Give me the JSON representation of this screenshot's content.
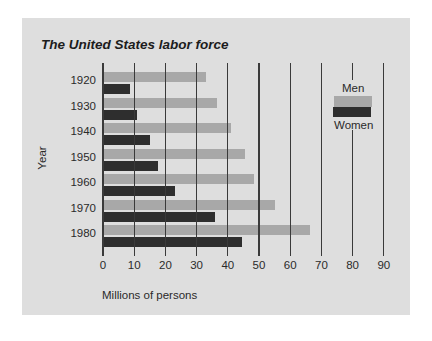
{
  "chart_data": {
    "type": "bar",
    "orientation": "horizontal",
    "title": "The United States labor force",
    "xlabel": "Millions of persons",
    "ylabel": "Year",
    "categories": [
      "1920",
      "1930",
      "1940",
      "1950",
      "1960",
      "1970",
      "1980"
    ],
    "series": [
      {
        "name": "Men",
        "color": "#a8a8a8",
        "values": [
          33,
          36.5,
          41,
          45.5,
          48.5,
          55,
          66.5
        ]
      },
      {
        "name": "Women",
        "color": "#2e2e2e",
        "values": [
          8.5,
          11,
          15,
          17.5,
          23,
          36,
          44.5
        ]
      }
    ],
    "xlim": [
      0,
      90
    ],
    "xticks": [
      "0",
      "10",
      "20",
      "30",
      "40",
      "50",
      "60",
      "70",
      "80",
      "90"
    ],
    "grid": "vertical lines at each 10",
    "legend": {
      "position": "right, inside plot",
      "entries": [
        "Men",
        "Women"
      ]
    }
  }
}
